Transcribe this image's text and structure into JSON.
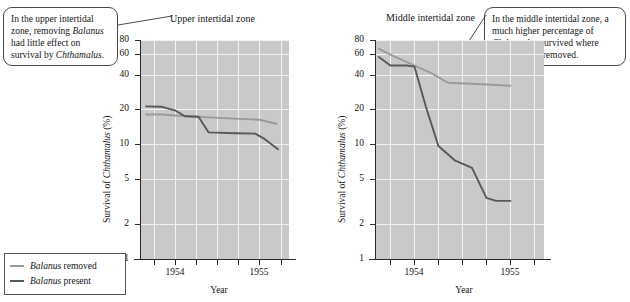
{
  "callouts": {
    "left": {
      "name": "upper-zone-annotation",
      "text_plain": "In the upper intertidal zone, removing Balanus had little effect on survival by Chthamalus.",
      "parts": [
        {
          "t": "In the upper intertidal zone, removing ",
          "i": false
        },
        {
          "t": "Balanus",
          "i": true
        },
        {
          "t": " had little effect on survival by ",
          "i": false
        },
        {
          "t": "Chthamalus",
          "i": true
        },
        {
          "t": ".",
          "i": false
        }
      ]
    },
    "right": {
      "name": "middle-zone-annotation",
      "text_plain": "In the middle intertidal zone, a much higher percentage of Chthamalus survived where Balanus was removed.",
      "parts": [
        {
          "t": "In the middle intertidal zone, a much higher percentage of ",
          "i": false
        },
        {
          "t": "Chthamalus",
          "i": true
        },
        {
          "t": " survived where ",
          "i": false
        },
        {
          "t": "Balanus",
          "i": true
        },
        {
          "t": " was removed.",
          "i": false
        }
      ]
    }
  },
  "legend": {
    "items": [
      {
        "label_parts": [
          {
            "t": "Balanus",
            "i": true
          },
          {
            "t": " removed",
            "i": false
          }
        ],
        "label_plain": "Balanus removed",
        "color": "#9a9a9a"
      },
      {
        "label_parts": [
          {
            "t": "Balanus",
            "i": true
          },
          {
            "t": " present",
            "i": false
          }
        ],
        "label_plain": "Balanus present",
        "color": "#585858"
      }
    ]
  },
  "colors": {
    "plot_background": "#c9c9c9",
    "gridline": "#f3f3f3",
    "axis": "#2a2a2a",
    "series_removed": "#9a9a9a",
    "series_present": "#585858",
    "callout_border": "#4a4a4a",
    "page_background": "#ffffff"
  },
  "chart_data": [
    {
      "type": "line",
      "name": "upper-intertidal-chart",
      "title": "Upper intertidal zone",
      "xlabel": "Year",
      "ylabel": "Survival of Chthamalus (%)",
      "yscale": "log",
      "ylim": [
        1,
        80
      ],
      "yticks": [
        1,
        2,
        5,
        10,
        20,
        40,
        60,
        80
      ],
      "ytick_labels": [
        "1",
        "2",
        "5",
        "10",
        "20",
        "40",
        "60",
        "80"
      ],
      "xlim": [
        1953.6,
        1955.35
      ],
      "xticks": [
        1953.75,
        1954.0,
        1954.25,
        1954.5,
        1954.75,
        1955.0,
        1955.25
      ],
      "xtick_labels": [
        "",
        "1954",
        "",
        "",
        "",
        "1955",
        ""
      ],
      "xlabeled_ticks": [
        {
          "x": 1954.0,
          "label": "1954"
        },
        {
          "x": 1955.0,
          "label": "1955"
        }
      ],
      "grid": true,
      "series": [
        {
          "name": "Balanus removed",
          "color": "#9a9a9a",
          "x": [
            1953.66,
            1953.85,
            1954.05,
            1954.22,
            1954.4,
            1954.7,
            1955.0,
            1955.2
          ],
          "values": [
            18.0,
            18.0,
            17.6,
            17.3,
            17.0,
            16.6,
            16.2,
            15.0
          ]
        },
        {
          "name": "Balanus present",
          "color": "#585858",
          "x": [
            1953.66,
            1953.85,
            1954.0,
            1954.12,
            1954.28,
            1954.4,
            1954.72,
            1954.95,
            1955.05,
            1955.22
          ],
          "values": [
            21.2,
            21.0,
            19.6,
            17.4,
            17.2,
            12.6,
            12.4,
            12.3,
            11.2,
            9.0
          ]
        }
      ]
    },
    {
      "type": "line",
      "name": "middle-intertidal-chart",
      "title": "Middle intertidal zone",
      "xlabel": "Year",
      "ylabel": "Survival of Chthamalus (%)",
      "yscale": "log",
      "ylim": [
        1,
        80
      ],
      "yticks": [
        1,
        2,
        5,
        10,
        20,
        40,
        60,
        80
      ],
      "ytick_labels": [
        "1",
        "2",
        "5",
        "10",
        "20",
        "40",
        "60",
        "80"
      ],
      "xlim": [
        1953.6,
        1955.35
      ],
      "xticks": [
        1953.75,
        1954.0,
        1954.25,
        1954.5,
        1954.75,
        1955.0,
        1955.25
      ],
      "xtick_labels": [
        "",
        "1954",
        "",
        "",
        "",
        "1955",
        ""
      ],
      "xlabeled_ticks": [
        {
          "x": 1954.0,
          "label": "1954"
        },
        {
          "x": 1955.0,
          "label": "1955"
        }
      ],
      "grid": true,
      "series": [
        {
          "name": "Balanus removed",
          "color": "#9a9a9a",
          "x": [
            1953.63,
            1953.8,
            1954.0,
            1954.18,
            1954.35,
            1954.7,
            1955.0
          ],
          "values": [
            67.0,
            57.0,
            48.0,
            41.0,
            34.0,
            33.0,
            32.0
          ]
        },
        {
          "name": "Balanus present",
          "color": "#585858",
          "x": [
            1953.63,
            1953.75,
            1953.92,
            1954.0,
            1954.12,
            1954.25,
            1954.42,
            1954.6,
            1954.75,
            1954.85,
            1955.0
          ],
          "values": [
            57.0,
            48.0,
            48.0,
            47.0,
            21.0,
            9.6,
            7.2,
            6.2,
            3.4,
            3.2,
            3.2
          ]
        }
      ]
    }
  ]
}
